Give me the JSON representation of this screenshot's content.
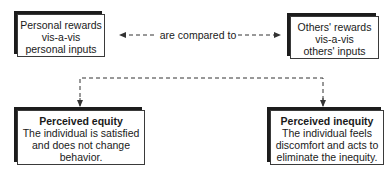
{
  "diagram": {
    "nodes": {
      "personal": {
        "lines": [
          "Personal rewards",
          "vis-a-vis",
          "personal inputs"
        ]
      },
      "others": {
        "lines": [
          "Others' rewards",
          "vis-a-vis",
          "others' inputs"
        ]
      },
      "equity": {
        "title": "Perceived equity",
        "lines": [
          "The individual is satisfied",
          "and does not change",
          "behavior."
        ]
      },
      "inequity": {
        "title": "Perceived inequity",
        "lines": [
          "The individual feels",
          "discomfort and acts to",
          "eliminate the inequity."
        ]
      }
    },
    "edges": {
      "compare": {
        "label": "are compared to",
        "style": "dashed",
        "direction": "bidirectional"
      },
      "outcome": {
        "style": "dashed",
        "targets": [
          "equity",
          "inequity"
        ]
      }
    },
    "colors": {
      "box_border": "#3a3a3a",
      "box_shadow": "#1c1c1c",
      "text": "#1a1a1a",
      "line": "#333333"
    }
  }
}
